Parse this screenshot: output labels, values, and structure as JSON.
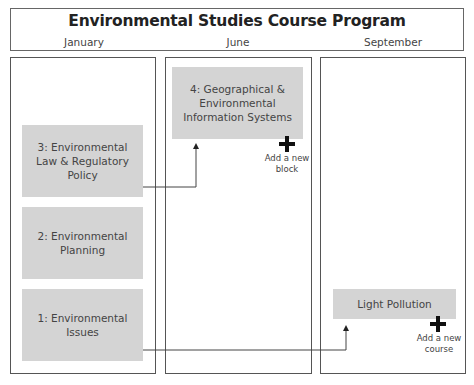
{
  "header": {
    "title": "Environmental Studies Course Program",
    "months": [
      "January",
      "June",
      "September"
    ]
  },
  "columns": [
    {
      "month": "January",
      "blocks": [
        {
          "label": "3: Environmental Law & Regulatory Policy"
        },
        {
          "label": "2: Environmental Planning"
        },
        {
          "label": "1: Environmental Issues"
        }
      ]
    },
    {
      "month": "June",
      "blocks": [
        {
          "label": "4: Geographical & Environmental Information Systems"
        }
      ],
      "add_action": {
        "line1": "Add a new",
        "line2": "block",
        "icon": "plus-icon"
      }
    },
    {
      "month": "September",
      "blocks": [
        {
          "label": "Light Pollution"
        }
      ],
      "add_action": {
        "line1": "Add a new",
        "line2": "course",
        "icon": "plus-icon"
      }
    }
  ],
  "connections": [
    {
      "from": "3: Environmental Law & Regulatory Policy",
      "to": "4: Geographical & Environmental Information Systems"
    },
    {
      "from": "1: Environmental Issues",
      "to": "Light Pollution"
    }
  ],
  "colors": {
    "block_fill": "#d4d4d4",
    "border": "#555555",
    "text": "#444444"
  }
}
